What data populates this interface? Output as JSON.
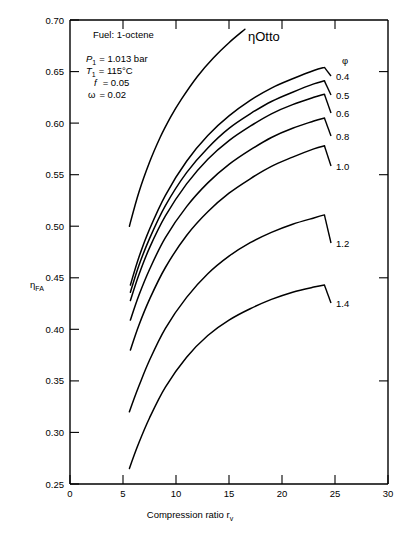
{
  "chart_data": {
    "type": "line",
    "title": "",
    "xlabel": "Compression ratio r_v",
    "ylabel": "ηFA",
    "xlim": [
      0,
      30
    ],
    "ylim": [
      0.25,
      0.7
    ],
    "xticks": [
      "0",
      "5",
      "10",
      "15",
      "20",
      "25",
      "30"
    ],
    "yticks": [
      "0.25",
      "0.30",
      "0.35",
      "0.40",
      "0.45",
      "0.50",
      "0.55",
      "0.60",
      "0.65",
      "0.70"
    ],
    "grid": false,
    "legend_position": "right-inline",
    "series": [
      {
        "name": "ηOtto",
        "label": "ηOtto",
        "x": [
          5.6,
          6.5,
          7.5,
          8.5,
          9.5,
          10.5,
          12,
          13.5,
          15,
          16.5
        ],
        "y": [
          0.5,
          0.533,
          0.562,
          0.586,
          0.606,
          0.623,
          0.645,
          0.663,
          0.678,
          0.691
        ]
      },
      {
        "name": "phi-0.4",
        "label": "0.4",
        "x": [
          5.7,
          6.5,
          7.5,
          9,
          11,
          13,
          15,
          17,
          19,
          21,
          23,
          24
        ],
        "y": [
          0.443,
          0.47,
          0.497,
          0.53,
          0.563,
          0.588,
          0.607,
          0.622,
          0.634,
          0.643,
          0.651,
          0.654
        ]
      },
      {
        "name": "phi-0.5",
        "label": "0.5",
        "x": [
          5.7,
          6.5,
          7.5,
          9,
          11,
          13,
          15,
          17,
          19,
          21,
          23,
          24
        ],
        "y": [
          0.436,
          0.462,
          0.488,
          0.52,
          0.552,
          0.576,
          0.595,
          0.609,
          0.621,
          0.63,
          0.638,
          0.641
        ]
      },
      {
        "name": "phi-0.6",
        "label": "0.6",
        "x": [
          5.7,
          6.5,
          7.5,
          9,
          11,
          13,
          15,
          17,
          19,
          21,
          23,
          24
        ],
        "y": [
          0.428,
          0.453,
          0.479,
          0.51,
          0.541,
          0.565,
          0.583,
          0.597,
          0.609,
          0.618,
          0.625,
          0.628
        ]
      },
      {
        "name": "phi-0.8",
        "label": "0.8",
        "x": [
          5.7,
          6.5,
          7.5,
          9,
          11,
          13,
          15,
          17,
          19,
          21,
          23,
          24
        ],
        "y": [
          0.409,
          0.433,
          0.458,
          0.489,
          0.519,
          0.542,
          0.56,
          0.574,
          0.586,
          0.595,
          0.602,
          0.605
        ]
      },
      {
        "name": "phi-1.0",
        "label": "1.0",
        "x": [
          5.7,
          6.5,
          7.5,
          9,
          11,
          13,
          15,
          17,
          19,
          21,
          23,
          24
        ],
        "y": [
          0.38,
          0.404,
          0.429,
          0.46,
          0.491,
          0.514,
          0.532,
          0.546,
          0.558,
          0.567,
          0.575,
          0.578
        ]
      },
      {
        "name": "phi-1.2",
        "label": "1.2",
        "x": [
          5.6,
          6.5,
          7.5,
          9,
          11,
          13,
          15,
          17,
          19,
          21,
          23,
          24
        ],
        "y": [
          0.32,
          0.345,
          0.37,
          0.401,
          0.431,
          0.454,
          0.471,
          0.484,
          0.494,
          0.502,
          0.508,
          0.511
        ]
      },
      {
        "name": "phi-1.4",
        "label": "1.4",
        "x": [
          5.6,
          6.5,
          7.5,
          9,
          11,
          13,
          15,
          17,
          19,
          21,
          23,
          24
        ],
        "y": [
          0.265,
          0.29,
          0.314,
          0.344,
          0.373,
          0.394,
          0.409,
          0.42,
          0.429,
          0.436,
          0.441,
          0.443
        ]
      }
    ],
    "annotations": {
      "fuel": "Fuel: 1-octene",
      "p1": "P",
      "p1_sub": "1",
      "p1_value": "= 1.013 bar",
      "t1": "T",
      "t1_sub": "1",
      "t1_value": "= 115°C",
      "f": "f",
      "f_value": "= 0.05",
      "omega": "ω",
      "omega_value": "= 0.02",
      "legend_header": "φ",
      "otto_label": "ηOtto"
    }
  },
  "axes": {
    "y_label_main": "η",
    "y_label_sub": "FA",
    "x_label_main": "Compression ratio r",
    "x_label_sub": "v"
  }
}
